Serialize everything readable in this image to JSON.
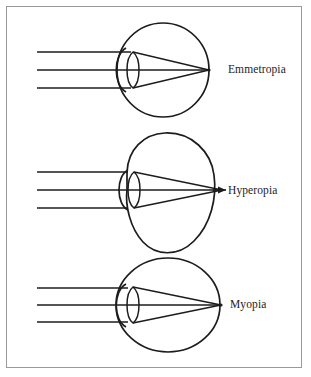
{
  "figure": {
    "border_color": "#9a9a9a",
    "background_color": "#ffffff",
    "stroke_color": "#1c1c1c"
  },
  "diagrams": [
    {
      "id": "emmetropia",
      "label": "Emmetropia",
      "eye_shape": "round",
      "focal_point": "on-retina",
      "focal_point_description": "Light rays converge exactly on the retina at the back of the eye.",
      "ray_count": 3,
      "has_arrow": false,
      "center_y": 70
    },
    {
      "id": "hyperopia",
      "label": "Hyperopia",
      "eye_shape": "short-flattened",
      "focal_point": "behind-retina",
      "focal_point_description": "Light rays converge behind the retina; the eye is too short.",
      "ray_count": 3,
      "has_arrow": true,
      "center_y": 190
    },
    {
      "id": "myopia",
      "label": "Myopia",
      "eye_shape": "elongated",
      "focal_point": "in-front-of-retina",
      "focal_point_description": "Light rays converge in front of the retina; the eye is too long.",
      "ray_count": 3,
      "has_arrow": false,
      "center_y": 305
    }
  ],
  "components": {
    "lens_name": "lens",
    "cornea_name": "cornea",
    "retina_name": "retina",
    "incoming_rays_name": "parallel light rays"
  }
}
